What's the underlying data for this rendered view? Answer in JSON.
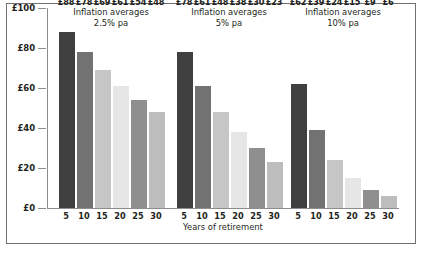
{
  "chart_data": {
    "type": "bar",
    "title": "",
    "xlabel": "Years of retirement",
    "ylabel": "",
    "categories": [
      "5",
      "10",
      "15",
      "20",
      "25",
      "30"
    ],
    "ylim": [
      0,
      100
    ],
    "y_ticks": [
      0,
      20,
      40,
      60,
      80,
      100
    ],
    "y_tick_labels": [
      "£0",
      "£20",
      "£40",
      "£60",
      "£80",
      "£100"
    ],
    "grid": false,
    "legend": "none",
    "currency_prefix": "£",
    "panels": [
      {
        "title_line1": "Inflation averages",
        "title_line2": "2.5% pa",
        "values": [
          88,
          78,
          69,
          61,
          54,
          48
        ],
        "value_labels": [
          "£88",
          "£78",
          "£69",
          "£61",
          "£54",
          "£48"
        ]
      },
      {
        "title_line1": "Inflation averages",
        "title_line2": "5% pa",
        "values": [
          78,
          61,
          48,
          38,
          30,
          23
        ],
        "value_labels": [
          "£78",
          "£61",
          "£48",
          "£38",
          "£30",
          "£23"
        ]
      },
      {
        "title_line1": "Inflation averages",
        "title_line2": "10% pa",
        "values": [
          62,
          39,
          24,
          15,
          9,
          6
        ],
        "value_labels": [
          "£62",
          "£39",
          "£24",
          "£15",
          "£9",
          "£6"
        ]
      }
    ],
    "bar_colors": [
      "#3f3f3f",
      "#727272",
      "#c6c6c6",
      "#e6e6e6",
      "#8f8f8f",
      "#bdbdbd"
    ],
    "axis_color": "#8d8d8d",
    "frame_color": "#6f6f6f",
    "text_color": "#231f20",
    "background": "#ffffff"
  }
}
